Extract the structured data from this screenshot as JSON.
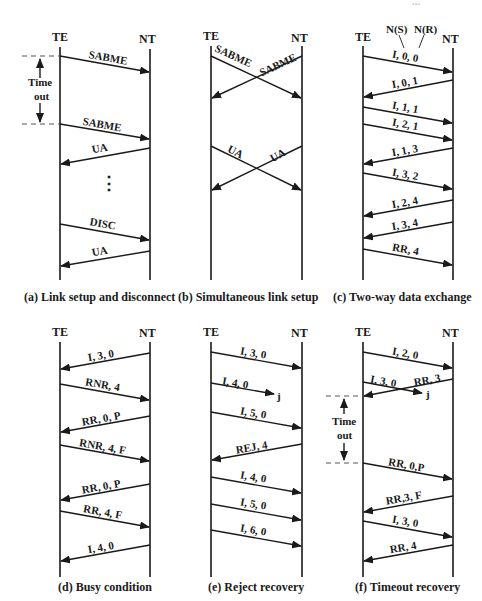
{
  "figure": {
    "top_edge_fragment": "...",
    "panels": [
      {
        "id": "a",
        "caption": "(a) Link setup and disconnect",
        "te_label": "TE",
        "nt_label": "NT",
        "messages": [
          {
            "label": "SABME",
            "dir": "TE->NT"
          },
          {
            "label": "SABME",
            "dir": "TE->NT"
          },
          {
            "label": "UA",
            "dir": "NT->TE"
          },
          {
            "label": "DISC",
            "dir": "TE->NT"
          },
          {
            "label": "UA",
            "dir": "NT->TE"
          }
        ],
        "timeout_label_1": "Time",
        "timeout_label_2": "out",
        "ellipsis": "⋮"
      },
      {
        "id": "b",
        "caption": "(b) Simultaneous link setup",
        "te_label": "TE",
        "nt_label": "NT",
        "messages": [
          {
            "label": "SABME",
            "dir": "TE->NT"
          },
          {
            "label": "SABME",
            "dir": "NT->TE"
          },
          {
            "label": "UA",
            "dir": "TE->NT"
          },
          {
            "label": "UA",
            "dir": "NT->TE"
          }
        ]
      },
      {
        "id": "c",
        "caption": "(c) Two-way data exchange",
        "te_label": "TE",
        "nt_label": "NT",
        "annotation_ns": "N(S)",
        "annotation_nr": "N(R)",
        "messages": [
          {
            "label": "I, 0, 0",
            "dir": "TE->NT"
          },
          {
            "label": "I, 0, 1",
            "dir": "NT->TE"
          },
          {
            "label": "I, 1, 1",
            "dir": "TE->NT"
          },
          {
            "label": "I, 2, 1",
            "dir": "TE->NT"
          },
          {
            "label": "I, 1, 3",
            "dir": "NT->TE"
          },
          {
            "label": "I, 3, 2",
            "dir": "TE->NT"
          },
          {
            "label": "I, 2, 4",
            "dir": "NT->TE"
          },
          {
            "label": "I, 3, 4",
            "dir": "NT->TE"
          },
          {
            "label": "RR, 4",
            "dir": "TE->NT"
          }
        ]
      },
      {
        "id": "d",
        "caption": "(d) Busy condition",
        "te_label": "TE",
        "nt_label": "NT",
        "messages": [
          {
            "label": "I, 3, 0",
            "dir": "NT->TE"
          },
          {
            "label": "RNR, 4",
            "dir": "TE->NT"
          },
          {
            "label": "RR, 0, P",
            "dir": "NT->TE"
          },
          {
            "label": "RNR, 4, F",
            "dir": "TE->NT"
          },
          {
            "label": "RR, 0, P",
            "dir": "NT->TE"
          },
          {
            "label": "RR, 4, F",
            "dir": "TE->NT"
          },
          {
            "label": "I, 4, 0",
            "dir": "NT->TE"
          }
        ]
      },
      {
        "id": "e",
        "caption": "(e) Reject recovery",
        "te_label": "TE",
        "nt_label": "NT",
        "lost_marker": "j",
        "messages": [
          {
            "label": "I, 3, 0",
            "dir": "TE->NT"
          },
          {
            "label": "I, 4, 0",
            "dir": "TE->lost"
          },
          {
            "label": "I, 5, 0",
            "dir": "TE->NT"
          },
          {
            "label": "REJ, 4",
            "dir": "NT->TE"
          },
          {
            "label": "I, 4, 0",
            "dir": "TE->NT"
          },
          {
            "label": "I, 5, 0",
            "dir": "TE->NT"
          },
          {
            "label": "I, 6, 0",
            "dir": "TE->NT"
          }
        ]
      },
      {
        "id": "f",
        "caption": "(f) Timeout recovery",
        "te_label": "TE",
        "nt_label": "NT",
        "lost_marker": "j",
        "timeout_label_1": "Time",
        "timeout_label_2": "out",
        "messages": [
          {
            "label": "I, 2, 0",
            "dir": "TE->NT"
          },
          {
            "label": "I, 3, 0",
            "dir": "TE->lost"
          },
          {
            "label": "RR, 3",
            "dir": "NT->TE"
          },
          {
            "label": "RR, 0,P",
            "dir": "TE->NT"
          },
          {
            "label": "RR,3, F",
            "dir": "NT->TE"
          },
          {
            "label": "I, 3, 0",
            "dir": "TE->NT"
          },
          {
            "label": "RR, 4",
            "dir": "NT->TE"
          }
        ]
      }
    ]
  }
}
